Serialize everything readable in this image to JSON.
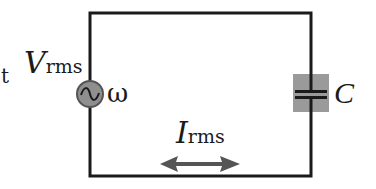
{
  "diagram": {
    "type": "AC capacitor circuit",
    "left_fragment": "t",
    "source": {
      "symbol": "ac-voltage-source",
      "voltage_label": {
        "main": "V",
        "sub": "rms"
      },
      "frequency_label": "ω"
    },
    "capacitor": {
      "symbol": "capacitor",
      "label": "C"
    },
    "current": {
      "label": {
        "main": "I",
        "sub": "rms"
      },
      "direction": "bidirectional"
    },
    "colors": {
      "wire": "#1a1a1a",
      "component_fill": "#8f8f8f",
      "arrow": "#555555",
      "background": "#ffffff"
    }
  }
}
